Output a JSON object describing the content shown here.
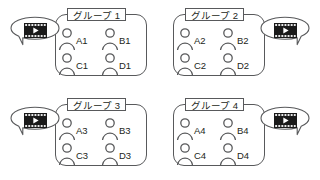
{
  "diagram": {
    "title": "",
    "colors": {
      "stroke": "#58595b",
      "text": "#231f20",
      "background": "#ffffff",
      "film_body": "#1a1a1a",
      "film_play": "#ffffff"
    },
    "icons": {
      "video": "film-play-icon",
      "person": "person-icon",
      "bubble": "speech-bubble"
    },
    "groups": [
      {
        "label": "グループ 1",
        "bubble_side": "left",
        "video_icon": "film-play-icon",
        "members": [
          {
            "id": "A1"
          },
          {
            "id": "B1"
          },
          {
            "id": "C1"
          },
          {
            "id": "D1"
          }
        ]
      },
      {
        "label": "グループ 2",
        "bubble_side": "right",
        "video_icon": "film-play-icon",
        "members": [
          {
            "id": "A2"
          },
          {
            "id": "B2"
          },
          {
            "id": "C2"
          },
          {
            "id": "D2"
          }
        ]
      },
      {
        "label": "グループ 3",
        "bubble_side": "left",
        "video_icon": "film-play-icon",
        "members": [
          {
            "id": "A3"
          },
          {
            "id": "B3"
          },
          {
            "id": "C3"
          },
          {
            "id": "D3"
          }
        ]
      },
      {
        "label": "グループ 4",
        "bubble_side": "right",
        "video_icon": "film-play-icon",
        "members": [
          {
            "id": "A4"
          },
          {
            "id": "B4"
          },
          {
            "id": "C4"
          },
          {
            "id": "D4"
          }
        ]
      }
    ]
  }
}
